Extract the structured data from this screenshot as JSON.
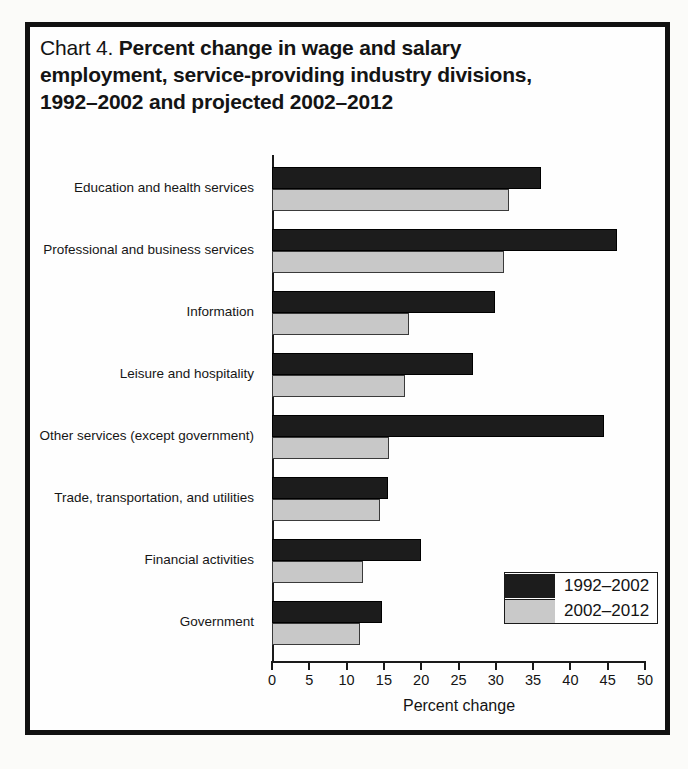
{
  "figure": {
    "title_prefix": "Chart 4.",
    "title_main": "Percent change in wage and salary employment, service-providing industry divisions, 1992–2002 and projected 2002–2012",
    "title_line1_bold": "Percent change in wage and salary",
    "title_line2_bold": "employment, service-providing industry divisions,",
    "title_line3_bold": "1992–2002 and projected 2002–2012"
  },
  "chart_data": {
    "type": "bar",
    "orientation": "horizontal",
    "title": "Chart 4. Percent change in wage and salary employment, service-providing industry divisions, 1992–2002 and projected 2002–2012",
    "xlabel": "Percent change",
    "ylabel": "",
    "xlim": [
      0,
      50
    ],
    "xticks": [
      0,
      5,
      10,
      15,
      20,
      25,
      30,
      35,
      40,
      45,
      50
    ],
    "xtick_labels": [
      "0",
      "5",
      "10",
      "15",
      "20",
      "25",
      "30",
      "35",
      "40",
      "45",
      "50"
    ],
    "grid": false,
    "legend_position": "bottom-right",
    "categories": [
      "Education and health services",
      "Professional and business services",
      "Information",
      "Leisure and hospitality",
      "Other services (except government)",
      "Trade, transportation, and utilities",
      "Financial activities",
      "Government"
    ],
    "series": [
      {
        "name": "1992–2002",
        "color": "#1c1c1c",
        "values": [
          36.0,
          46.2,
          29.9,
          26.9,
          44.5,
          15.5,
          20.0,
          14.8
        ]
      },
      {
        "name": "2002–2012",
        "color": "#c8c8c8",
        "values": [
          31.8,
          31.1,
          18.4,
          17.8,
          15.7,
          14.5,
          12.2,
          11.8
        ]
      }
    ]
  },
  "legend": {
    "entries": [
      {
        "label": "1992–2002",
        "swatch": "dark"
      },
      {
        "label": "2002–2012",
        "swatch": "light"
      }
    ]
  }
}
